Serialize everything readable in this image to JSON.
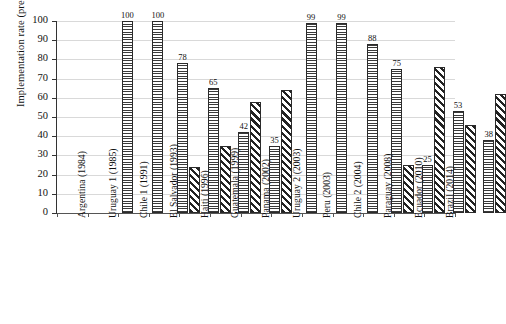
{
  "chart_data": {
    "type": "bar",
    "title": "",
    "xlabel": "",
    "ylabel": "Implementation rate (precentage)",
    "ylim": [
      0,
      100
    ],
    "ytick_values": [
      0,
      10,
      20,
      30,
      40,
      50,
      60,
      70,
      80,
      90,
      100
    ],
    "ytick_labels": [
      "0",
      "10",
      "20",
      "30",
      "40",
      "50",
      "60",
      "70",
      "80",
      "90",
      "100"
    ],
    "grid": "horizontal",
    "legend": "none",
    "categories": [
      "Argentina (1984)",
      "Uruguay 1 (1985)",
      "Chile 1 (1991)",
      "El Salvador (1993)",
      "Haiti (1996)",
      "Guatemala (1999)",
      "Panama (2002)",
      "Uruguay 2 (2003)",
      "Peru (2003)",
      "Chile 2 (2004)",
      "Paraguay (2008)",
      "Ecuador (2010)",
      "Brazil (2014)"
    ],
    "series": [
      {
        "name": "series-1",
        "pattern": "horizontal-hatch",
        "labeled": true,
        "values": [
          100,
          100,
          78,
          65,
          42,
          35,
          99,
          99,
          88,
          75,
          25,
          53,
          38
        ],
        "value_labels": [
          "100",
          "100",
          "78",
          "65",
          "42",
          "35",
          "99",
          "99",
          "88",
          "75",
          "25",
          "53",
          "38"
        ]
      },
      {
        "name": "series-2",
        "pattern": "diagonal-hatch",
        "labeled": false,
        "values": [
          0,
          0,
          24,
          35,
          58,
          64,
          0,
          0,
          0,
          25,
          76,
          46,
          62
        ],
        "value_labels": [
          "",
          "",
          "",
          "",
          "",
          "",
          "",
          "",
          "",
          "",
          "",
          "",
          ""
        ]
      }
    ]
  }
}
